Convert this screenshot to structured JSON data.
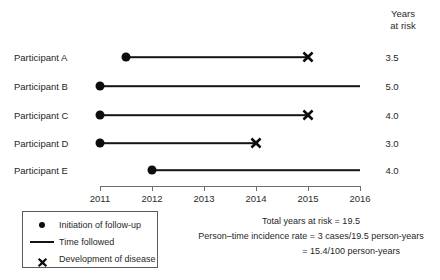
{
  "chart_data": {
    "type": "timeline",
    "title": "",
    "xlabel": "",
    "ylabel": "",
    "x_axis": {
      "ticks": [
        "2011",
        "2012",
        "2013",
        "2014",
        "2015",
        "2016"
      ],
      "min": 2011,
      "max": 2016,
      "grid": false
    },
    "value_column_header_line1": "Years",
    "value_column_header_line2": "at risk",
    "series_name": "Participants",
    "participants": [
      {
        "label": "Participant A",
        "start": 2011.5,
        "end": 2015.0,
        "event": true,
        "years_at_risk": "3.5"
      },
      {
        "label": "Participant B",
        "start": 2011.0,
        "end": 2016.0,
        "event": false,
        "years_at_risk": "5.0"
      },
      {
        "label": "Participant C",
        "start": 2011.0,
        "end": 2015.0,
        "event": true,
        "years_at_risk": "4.0"
      },
      {
        "label": "Participant D",
        "start": 2011.0,
        "end": 2014.0,
        "event": true,
        "years_at_risk": "3.0"
      },
      {
        "label": "Participant E",
        "start": 2012.0,
        "end": 2016.0,
        "event": false,
        "years_at_risk": "4.0"
      }
    ],
    "annotations": [
      "Total years at risk = 19.5",
      "Person–time incidence rate = 3 cases/19.5 person-years",
      "= 15.4/100  person-years"
    ]
  },
  "legend": {
    "position": "bottom-left",
    "items": [
      {
        "glyph": "dot",
        "label": "Initiation of follow-up"
      },
      {
        "glyph": "line",
        "label": "Time followed"
      },
      {
        "glyph": "cross",
        "label": "Development of disease"
      }
    ]
  },
  "colors": {
    "mark": "#0d0d0d",
    "line": "#141414",
    "axis": "#6e6e6e",
    "text": "#1f1f1f",
    "background": "#ffffff"
  }
}
